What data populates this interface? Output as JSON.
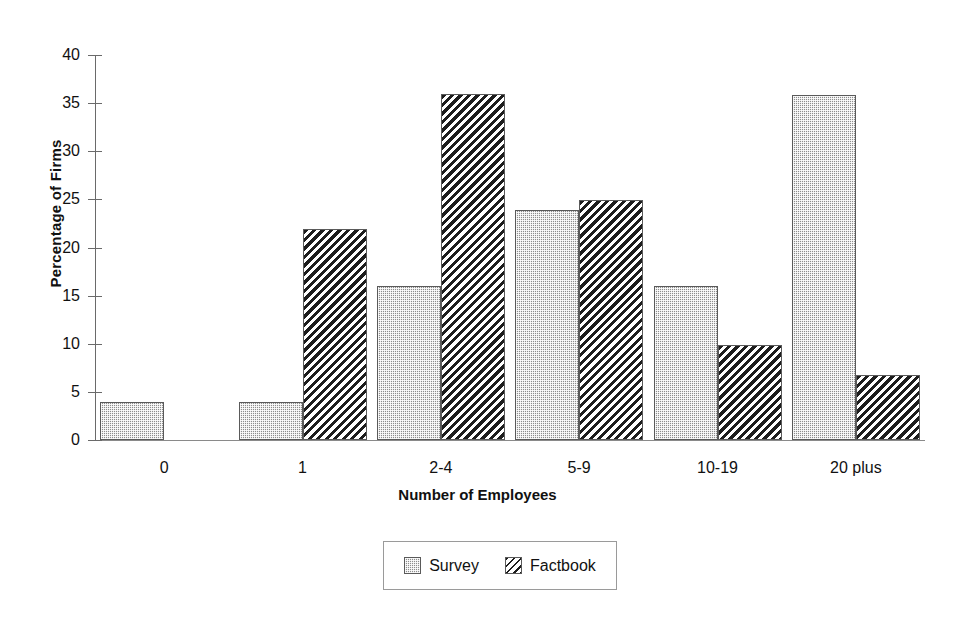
{
  "chart_data": {
    "type": "bar",
    "title": "",
    "subtitle": "",
    "xlabel": "Number of Employees",
    "ylabel": "Percentage of Firms",
    "categories": [
      "0",
      "1",
      "2-4",
      "5-9",
      "10-19",
      "20 plus"
    ],
    "series": [
      {
        "name": "Survey",
        "values": [
          4.0,
          4.0,
          16.0,
          23.9,
          16.0,
          35.8
        ]
      },
      {
        "name": "Factbook",
        "values": [
          0.0,
          21.9,
          35.9,
          24.9,
          9.9,
          6.8
        ]
      }
    ],
    "ylim": [
      0,
      40
    ],
    "yticks": [
      0,
      5,
      10,
      15,
      20,
      25,
      30,
      35,
      40
    ],
    "ytick_labels": [
      "0",
      "5",
      "10",
      "15",
      "20",
      "25",
      "30",
      "35",
      "40"
    ],
    "grid": false,
    "legend_position": "bottom-center",
    "legend_entries": [
      {
        "label": "Survey",
        "pattern": "stipple-gray"
      },
      {
        "label": "Factbook",
        "pattern": "diagonal-hatch"
      }
    ],
    "colors": {
      "survey_fill": "#8d8d8d",
      "factbook_fill": "#1d1d1d",
      "background": "#ffffff",
      "axis": "#6a6a6a",
      "text": "#111111"
    }
  }
}
